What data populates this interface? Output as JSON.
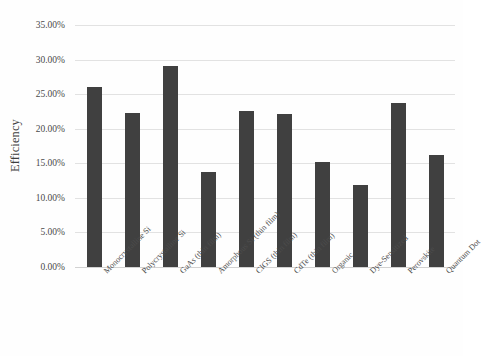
{
  "chart_data": {
    "type": "bar",
    "title": "",
    "xlabel": "",
    "ylabel": "Efficiency",
    "ylim": [
      0,
      35
    ],
    "y_tick_labels": [
      "0.00%",
      "5.00%",
      "10.00%",
      "15.00%",
      "20.00%",
      "25.00%",
      "30.00%",
      "35.00%"
    ],
    "y_tick_values": [
      0,
      5,
      10,
      15,
      20,
      25,
      30,
      35
    ],
    "grid": true,
    "legend": "none",
    "categories": [
      "Monocrystalline Si",
      "Polycrystalline Si",
      "GaAs (thin film)",
      "Amorphous Si (thin film)",
      "CIGS (thin film)",
      "CdTe (thin film)",
      "Organic",
      "Dye-Sensitized",
      "Perovskite",
      "Quantum Dot"
    ],
    "values": [
      26.1,
      22.3,
      29.1,
      13.8,
      22.6,
      22.1,
      15.2,
      11.9,
      23.7,
      16.2
    ],
    "bar_color": "#404040",
    "gridline_color": "#e2e2e2"
  }
}
